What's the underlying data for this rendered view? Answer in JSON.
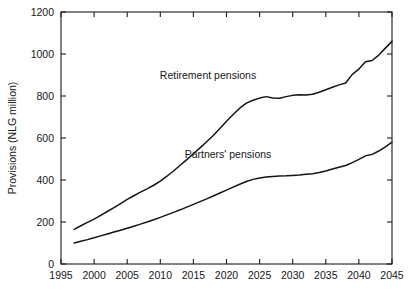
{
  "chart_data": {
    "type": "line",
    "title": "",
    "xlabel": "",
    "ylabel": "Provisions (NLG million)",
    "xlim": [
      1995,
      2045
    ],
    "ylim": [
      0,
      1200
    ],
    "grid": false,
    "legend_position": "inline-annotations",
    "x_ticks": [
      "1995",
      "2000",
      "2005",
      "2010",
      "2015",
      "2020",
      "2025",
      "2030",
      "2035",
      "2040",
      "2045"
    ],
    "y_ticks": [
      "0",
      "200",
      "400",
      "600",
      "800",
      "1000",
      "1200"
    ],
    "x": [
      1997,
      1998,
      1999,
      2000,
      2001,
      2002,
      2003,
      2004,
      2005,
      2006,
      2007,
      2008,
      2009,
      2010,
      2011,
      2012,
      2013,
      2014,
      2015,
      2016,
      2017,
      2018,
      2019,
      2020,
      2021,
      2022,
      2023,
      2024,
      2025,
      2026,
      2027,
      2028,
      2029,
      2030,
      2031,
      2032,
      2033,
      2034,
      2035,
      2036,
      2037,
      2038,
      2039,
      2040,
      2041,
      2042,
      2043,
      2044,
      2045
    ],
    "series": [
      {
        "name": "Retirement pensions",
        "label": "Retirement pensions",
        "color": "#141414",
        "values": [
          165,
          182,
          198,
          214,
          232,
          250,
          268,
          288,
          308,
          325,
          342,
          358,
          375,
          395,
          418,
          443,
          470,
          497,
          525,
          553,
          582,
          612,
          645,
          680,
          712,
          742,
          766,
          780,
          790,
          797,
          791,
          789,
          797,
          803,
          806,
          805,
          808,
          818,
          830,
          842,
          853,
          862,
          903,
          928,
          963,
          969,
          995,
          1028,
          1060
        ]
      },
      {
        "name": "Partners' pensions",
        "label": "Partners' pensions",
        "color": "#141414",
        "values": [
          100,
          108,
          116,
          125,
          134,
          143,
          152,
          161,
          170,
          180,
          190,
          200,
          211,
          222,
          234,
          246,
          258,
          271,
          284,
          297,
          310,
          324,
          338,
          352,
          366,
          380,
          393,
          403,
          410,
          414,
          417,
          419,
          420,
          422,
          424,
          427,
          430,
          436,
          443,
          452,
          461,
          469,
          483,
          498,
          515,
          522,
          538,
          558,
          580
        ]
      }
    ],
    "annotations": [
      {
        "text": "Retirement pensions",
        "x_px": 208,
        "y_px": 79
      },
      {
        "text": "Partners' pensions",
        "x_px": 228,
        "y_px": 158
      }
    ]
  }
}
